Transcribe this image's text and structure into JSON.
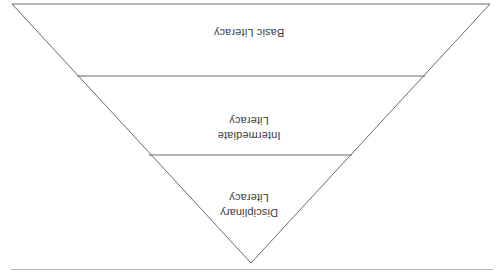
{
  "figure": {
    "type": "inverted-pyramid",
    "orientation": "rotated-180",
    "title": "",
    "outline_color": "#6b6b6b",
    "text_color": "#3a3a3a",
    "rule_color": "#b9b9b9",
    "background_color": "#ffffff",
    "bands": [
      {
        "id": "basic",
        "label": "Basic Literacy",
        "position": "top",
        "order": 1,
        "width_rank": "widest"
      },
      {
        "id": "intermediate",
        "label": "Intermediate\nLiteracy",
        "position": "middle",
        "order": 2,
        "width_rank": "medium"
      },
      {
        "id": "disciplinary",
        "label": "Disciplinary\nLiteracy",
        "position": "bottom",
        "order": 3,
        "width_rank": "narrowest"
      }
    ]
  },
  "page": {
    "rule_label": ""
  }
}
